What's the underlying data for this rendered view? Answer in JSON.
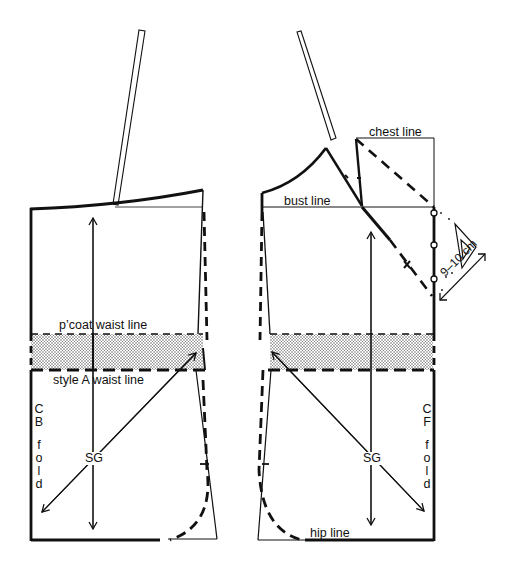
{
  "figure": {
    "title": "",
    "pieces": {
      "back": {
        "name": "Back",
        "fold_label": "CB fold",
        "fold_letters_top": [
          "C",
          "B"
        ],
        "fold_letters_bottom": [
          "f",
          "o",
          "l",
          "d"
        ],
        "grain_label": "SG"
      },
      "front": {
        "name": "Front",
        "fold_label": "CF fold",
        "fold_letters_top": [
          "C",
          "F"
        ],
        "fold_letters_bottom": [
          "f",
          "o",
          "l",
          "d"
        ],
        "grain_label": "SG"
      }
    },
    "labels": {
      "pcoat_waist_line": "p’coat waist line",
      "style_a_waist_line": "style A waist line",
      "chest_line": "chest line",
      "bust_line": "bust line",
      "hip_line": "hip line",
      "measurement": "9–10 cm"
    },
    "icons": {
      "set_square": "triangle-icon",
      "ruler": "ruler-icon"
    },
    "colors": {
      "ink": "#111111",
      "shading": "#9a9a9a",
      "background": "#ffffff"
    }
  }
}
